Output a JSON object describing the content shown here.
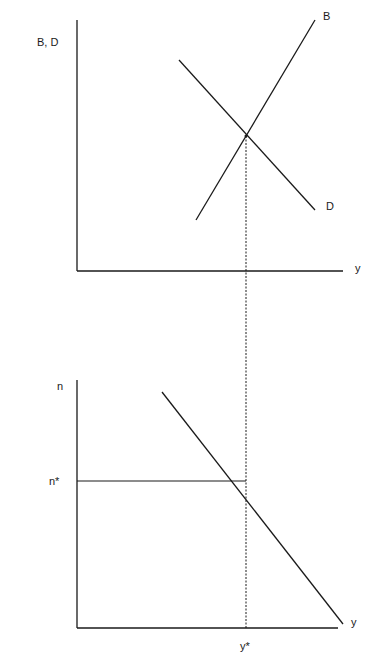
{
  "top_panel": {
    "y_axis_label": "B, D",
    "x_axis_label": "y",
    "curve_b_label": "B",
    "curve_d_label": "D"
  },
  "bottom_panel": {
    "y_axis_label": "n",
    "x_axis_label": "y",
    "n_star_label": "n*",
    "y_star_label": "y*"
  },
  "colors": {
    "line": "#1a1a1a",
    "background": "#ffffff"
  }
}
